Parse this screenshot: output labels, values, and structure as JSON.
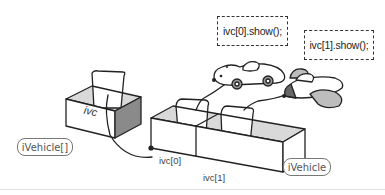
{
  "diagram": {
    "code_boxes": [
      {
        "text": "ivc[0].show();"
      },
      {
        "text": "ivc[1].show();"
      }
    ],
    "type_labels": {
      "array_type": "iVehicle[]",
      "element_type": "iVehicle"
    },
    "variable_box_label": "ivc",
    "element_labels": [
      "ivc[0]",
      "ivc[1]"
    ],
    "objects": [
      "car",
      "airplane"
    ],
    "colors": {
      "outline": "#222222",
      "shade_light": "#d9d9d9",
      "shade_dark": "#8a8a8a",
      "pill_border": "#777777",
      "background": "#ffffff"
    }
  }
}
